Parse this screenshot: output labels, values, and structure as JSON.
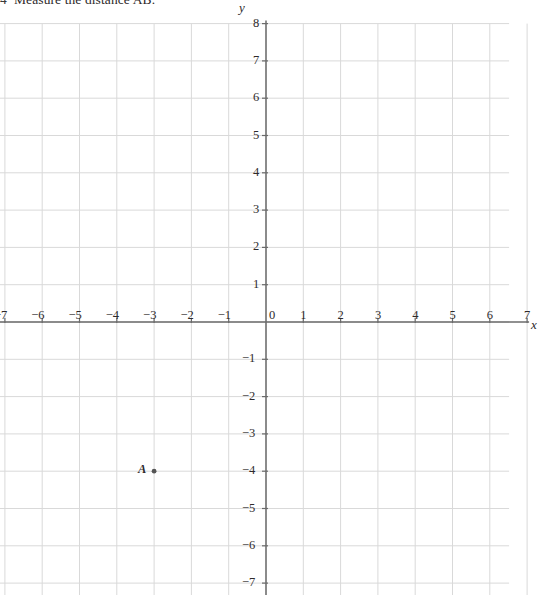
{
  "question": {
    "number": "4",
    "text": "Measure the distance AB."
  },
  "chart_data": {
    "type": "scatter",
    "title": "Measure the distance AB.",
    "xlabel": "x",
    "ylabel": "y",
    "xlim": [
      -7,
      7
    ],
    "ylim": [
      -7.6,
      8
    ],
    "grid": true,
    "grid_color": "#d9d9d9",
    "axis_color": "#6b6b6b",
    "legend": "none",
    "x_ticks": [
      -7,
      -6,
      -5,
      -4,
      -3,
      -2,
      -1,
      0,
      1,
      2,
      3,
      4,
      5,
      6,
      7
    ],
    "x_tick_labels": [
      "-7",
      "-6",
      "-5",
      "-4",
      "-3",
      "-2",
      "-1",
      "0",
      "1",
      "2",
      "3",
      "4",
      "5",
      "6",
      "7"
    ],
    "y_ticks": [
      8,
      7,
      6,
      5,
      4,
      3,
      2,
      1,
      -1,
      -2,
      -3,
      -4,
      -5,
      -6,
      -7
    ],
    "y_tick_labels": [
      "8",
      "7",
      "6",
      "5",
      "4",
      "3",
      "2",
      "1",
      "-1",
      "-2",
      "-3",
      "-4",
      "-5",
      "-6",
      "-7"
    ],
    "points": [
      {
        "label": "A",
        "x": -3,
        "y": -4
      }
    ]
  },
  "axis_labels": {
    "x": "x",
    "y": "y"
  },
  "colors": {
    "grid": "#d9d9d9",
    "axis": "#6b6b6b",
    "text": "#2e2a2b",
    "point": "#555555",
    "background": "#ffffff"
  }
}
